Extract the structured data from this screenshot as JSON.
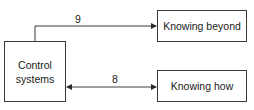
{
  "diagram": {
    "nodes": [
      {
        "id": "control",
        "label": "Control\nsystems"
      },
      {
        "id": "beyond",
        "label": "Knowing beyond"
      },
      {
        "id": "how",
        "label": "Knowing how"
      }
    ],
    "edges": [
      {
        "from": "control",
        "to": "beyond",
        "label": "9",
        "direction": "forward"
      },
      {
        "from": "control",
        "to": "how",
        "label": "8",
        "direction": "bidirectional"
      }
    ]
  },
  "colors": {
    "line": "#3a3a3a",
    "text": "#1a1a1a",
    "background": "#ffffff"
  }
}
